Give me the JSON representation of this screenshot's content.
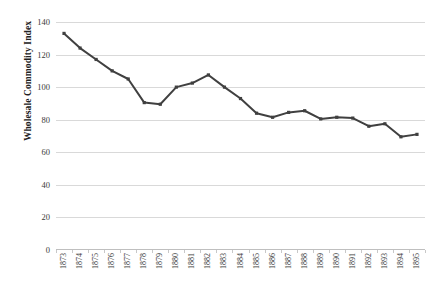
{
  "chart_data": {
    "type": "line",
    "title": "",
    "xlabel": "",
    "ylabel": "Wholesale Commodity Index",
    "ylim": [
      0,
      140
    ],
    "yticks": [
      0,
      20,
      40,
      60,
      80,
      100,
      120,
      140
    ],
    "grid": true,
    "legend": "none",
    "marker": "square",
    "series_color": "#404040",
    "gridline_color": "#D9D9D9",
    "categories": [
      "1873",
      "1874",
      "1875",
      "1876",
      "1877",
      "1878",
      "1879",
      "1880",
      "1881",
      "1882",
      "1883",
      "1884",
      "1885",
      "1886",
      "1887",
      "1888",
      "1889",
      "1890",
      "1891",
      "1892",
      "1893",
      "1894",
      "1895"
    ],
    "series": [
      {
        "name": "Wholesale Commodity Index",
        "values": [
          133,
          124,
          117,
          110,
          105,
          90.5,
          89.5,
          100,
          102.5,
          107.5,
          100,
          93,
          84,
          81.5,
          84.5,
          85.5,
          80.5,
          81.5,
          81,
          76,
          77.5,
          69.5,
          71
        ]
      }
    ]
  }
}
